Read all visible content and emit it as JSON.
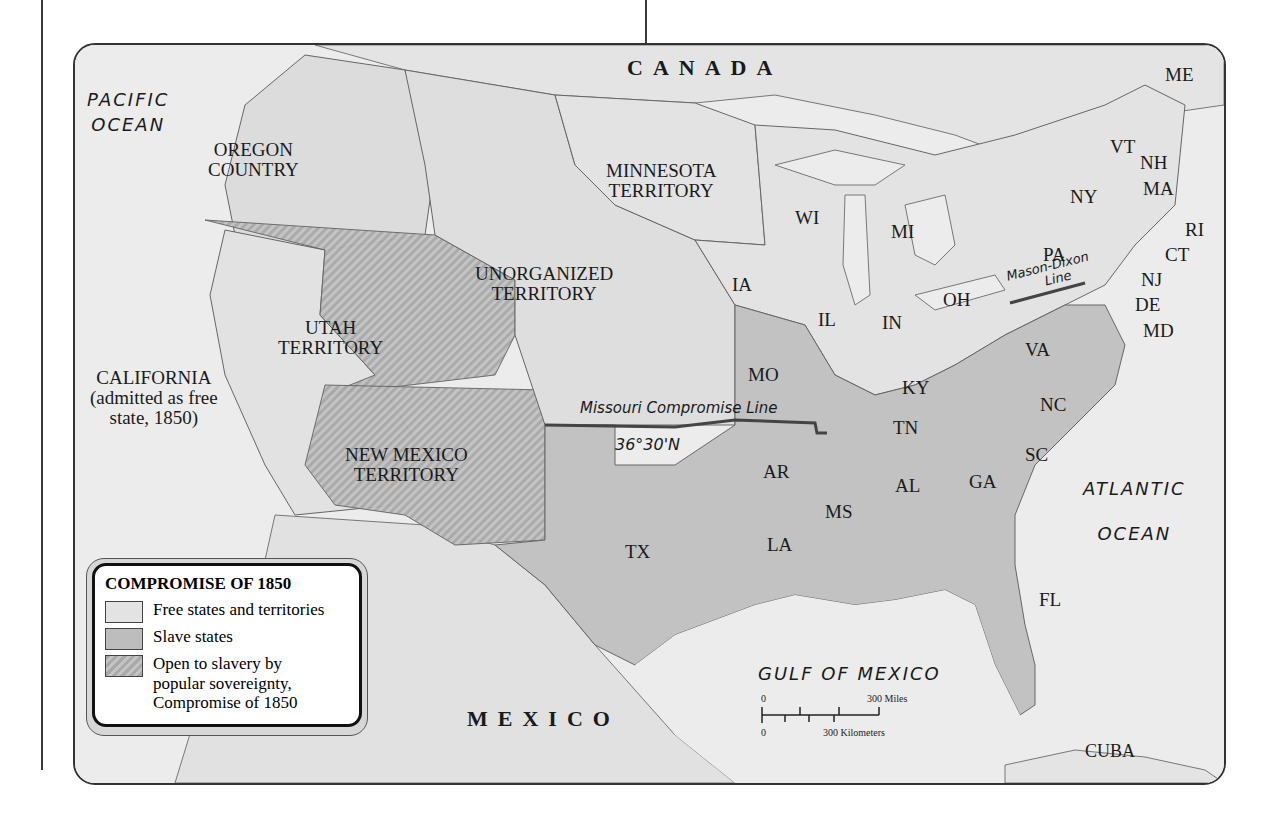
{
  "map": {
    "countries": {
      "canada": "CANADA",
      "mexico": "MEXICO",
      "cuba": "CUBA"
    },
    "oceans": {
      "pacific": [
        "PACIFIC",
        "OCEAN"
      ],
      "atlantic": [
        "ATLANTIC",
        "OCEAN"
      ],
      "gulf": "GULF OF MEXICO"
    },
    "territories": {
      "oregon": [
        "OREGON",
        "COUNTRY"
      ],
      "minnesota": [
        "MINNESOTA",
        "TERRITORY"
      ],
      "unorganized": [
        "UNORGANIZED",
        "TERRITORY"
      ],
      "utah": [
        "UTAH",
        "TERRITORY"
      ],
      "new_mexico": [
        "NEW MEXICO",
        "TERRITORY"
      ],
      "california": [
        "CALIFORNIA",
        "(admitted as free",
        "state, 1850)"
      ]
    },
    "states": {
      "ME": "ME",
      "VT": "VT",
      "NH": "NH",
      "MA": "MA",
      "RI": "RI",
      "CT": "CT",
      "NY": "NY",
      "NJ": "NJ",
      "DE": "DE",
      "MD": "MD",
      "PA": "PA",
      "WI": "WI",
      "MI": "MI",
      "IA": "IA",
      "IL": "IL",
      "IN": "IN",
      "OH": "OH",
      "MO": "MO",
      "KY": "KY",
      "VA": "VA",
      "NC": "NC",
      "TN": "TN",
      "AR": "AR",
      "SC": "SC",
      "GA": "GA",
      "AL": "AL",
      "MS": "MS",
      "LA": "LA",
      "TX": "TX",
      "FL": "FL"
    },
    "lines": {
      "missouri": "Missouri Compromise Line",
      "latitude": "36°30'N",
      "mason_dixon": [
        "Mason-Dixon",
        "Line"
      ]
    },
    "colors": {
      "free": "#e3e3e3",
      "slave": "#bdbdbd",
      "popular": "#b0b0b0",
      "water": "#ececec",
      "border": "#555555",
      "compromise_line": "#444444"
    }
  },
  "legend": {
    "title": "COMPROMISE OF 1850",
    "items": [
      {
        "label": "Free states and territories",
        "type": "free"
      },
      {
        "label": "Slave states",
        "type": "slave"
      },
      {
        "label": "Open to slavery by popular sovereignty, Compromise of 1850",
        "type": "popular"
      }
    ]
  },
  "scale": {
    "miles_start": "0",
    "miles_end": "300 Miles",
    "km_start": "0",
    "km_end": "300 Kilometers"
  }
}
